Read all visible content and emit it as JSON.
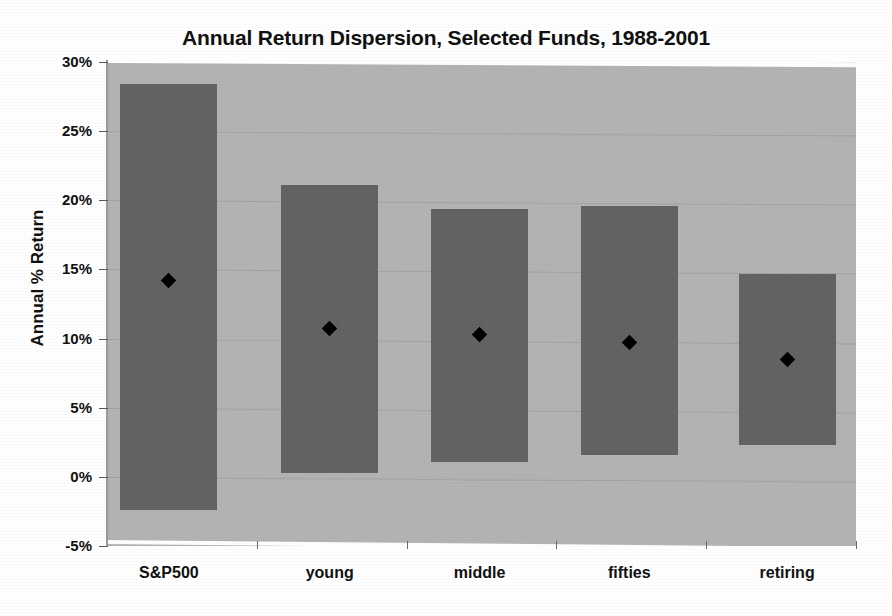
{
  "chart_data": {
    "type": "bar",
    "title": "Annual Return Dispersion, Selected Funds, 1988-2001",
    "xlabel": "",
    "ylabel": "Annual % Return",
    "categories": [
      "S&P500",
      "young",
      "middle",
      "fifties",
      "retiring"
    ],
    "ylim": [
      -5,
      30
    ],
    "ytick_labels": [
      "30%",
      "25%",
      "20%",
      "15%",
      "10%",
      "5%",
      "0%",
      "-5%"
    ],
    "ytick_values": [
      30,
      25,
      20,
      15,
      10,
      5,
      0,
      -5
    ],
    "grid": true,
    "legend": "none",
    "series": [
      {
        "name": "Range (high-low)",
        "type": "range-bar",
        "high": [
          28.4,
          21.1,
          19.4,
          19.6,
          14.7
        ],
        "low": [
          -2.4,
          0.3,
          1.1,
          1.6,
          2.3
        ]
      },
      {
        "name": "Average annual return",
        "type": "marker",
        "marker": "diamond",
        "values": [
          14.2,
          10.7,
          10.3,
          9.7,
          8.5
        ]
      }
    ],
    "colors": {
      "plot_background": "#b3b3b3",
      "bar_fill": "#636363",
      "marker": "#000000",
      "gridline": "#a3a3a3",
      "text": "#111111"
    }
  }
}
